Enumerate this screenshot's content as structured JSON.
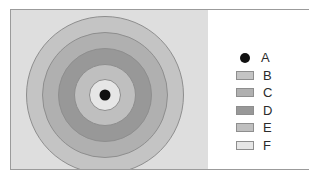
{
  "figure": {
    "background_color": "#ffffff",
    "frame_color": "#9b9b9b",
    "map_panel_color": "#dedede",
    "legend_panel_color": "#ffffff"
  },
  "chart_data": {
    "type": "pie",
    "title": "",
    "subtitle": "",
    "xlabel": "",
    "ylabel": "",
    "legend_position": "right",
    "grid": false,
    "center_point": {
      "label": "A",
      "color": "#111111",
      "cx": 105,
      "cy": 95,
      "radius": 5.5
    },
    "rings": [
      {
        "label": "F",
        "color": "#e6e6e6",
        "outer_radius": 16,
        "inner_radius": 0,
        "order": 1
      },
      {
        "label": "E",
        "color": "#bfbfbf",
        "outer_radius": 31,
        "inner_radius": 16,
        "order": 2
      },
      {
        "label": "D",
        "color": "#989898",
        "outer_radius": 47,
        "inner_radius": 31,
        "order": 3
      },
      {
        "label": "C",
        "color": "#b0b0b0",
        "outer_radius": 63,
        "inner_radius": 47,
        "order": 4
      },
      {
        "label": "B",
        "color": "#c4c4c4",
        "outer_radius": 79,
        "inner_radius": 63,
        "order": 5
      }
    ],
    "ring_outline_color": "#8e8e8e",
    "categories": [
      "A",
      "B",
      "C",
      "D",
      "E",
      "F"
    ],
    "values": [
      0,
      79,
      63,
      47,
      31,
      16
    ]
  },
  "legend": {
    "items": [
      {
        "label": "A",
        "symbol": "dot",
        "color": "#111111"
      },
      {
        "label": "B",
        "symbol": "swatch",
        "color": "#c4c4c4"
      },
      {
        "label": "C",
        "symbol": "swatch",
        "color": "#b0b0b0"
      },
      {
        "label": "D",
        "symbol": "swatch",
        "color": "#989898"
      },
      {
        "label": "E",
        "symbol": "swatch",
        "color": "#bfbfbf"
      },
      {
        "label": "F",
        "symbol": "swatch",
        "color": "#e6e6e6"
      }
    ]
  }
}
